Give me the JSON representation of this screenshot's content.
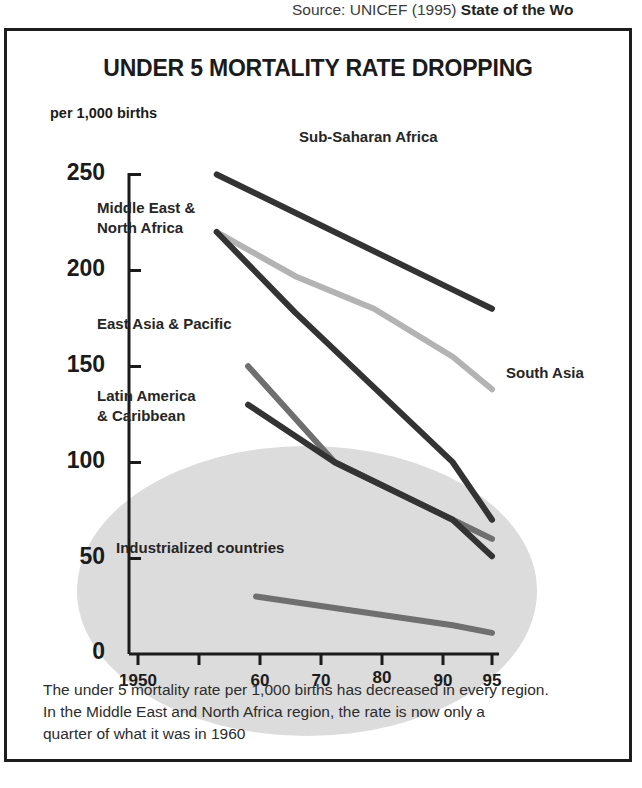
{
  "source": {
    "lead": "Source: UNICEF (1995) ",
    "title": "State of the Wo"
  },
  "chart_title": "UNDER 5 MORTALITY RATE DROPPING",
  "axis_unit": "per 1,000 births",
  "caption": {
    "line1": "The under 5 mortality rate per 1,000 births has decreased in every region.",
    "line2": "In the Middle East and North Africa region, the rate is now only a",
    "line3": "quarter of what it was in 1960"
  },
  "colors": {
    "dark": "#333333",
    "mid": "#6f6f6f",
    "light": "#b3b3b3",
    "axis": "#1b1b1b",
    "shadow": "#dcdcdc",
    "border": "#1d1d1d"
  },
  "chart_data": {
    "type": "line",
    "title": "UNDER 5 MORTALITY RATE DROPPING",
    "xlabel": "",
    "ylabel": "per 1,000 births",
    "ylim": [
      0,
      250
    ],
    "yticks": [
      0,
      50,
      100,
      150,
      200,
      250
    ],
    "ytick_labels": [
      "0",
      "50",
      "100",
      "150",
      "200",
      "250"
    ],
    "xlim": [
      1945,
      1997
    ],
    "xticks": [
      1950,
      1960,
      1970,
      1980,
      1990,
      1995
    ],
    "xtick_labels": [
      "1950",
      "60",
      "70",
      "80",
      "90",
      "95"
    ],
    "grid": false,
    "legend": "inline-labels",
    "series": [
      {
        "name": "Sub-Saharan Africa",
        "color": "#333333",
        "x": [
          1960,
          1990,
          1995
        ],
        "values": [
          250,
          190,
          180
        ],
        "label_x": 1972,
        "label_y": 258
      },
      {
        "name": "South Asia",
        "color": "#b3b3b3",
        "x": [
          1960,
          1970,
          1980,
          1990,
          1995
        ],
        "values": [
          220,
          197,
          180,
          155,
          138
        ],
        "label_x": 1997,
        "label_y": 140
      },
      {
        "name": "Middle East &\nNorth Africa",
        "color": "#333333",
        "x": [
          1960,
          1970,
          1990,
          1995
        ],
        "values": [
          220,
          178,
          100,
          70
        ],
        "label_x": 1953,
        "label_y": 205
      },
      {
        "name": "East Asia & Pacific",
        "color": "#6f6f6f",
        "x": [
          1964,
          1975,
          1990,
          1995
        ],
        "values": [
          150,
          100,
          70,
          60
        ],
        "label_x": 1953,
        "label_y": 158
      },
      {
        "name": "Latin America\n& Caribbean",
        "color": "#333333",
        "x": [
          1964,
          1975,
          1990,
          1995
        ],
        "values": [
          130,
          100,
          70,
          51
        ],
        "label_x": 1953,
        "label_y": 126
      },
      {
        "name": "Industrialized countries",
        "color": "#6f6f6f",
        "x": [
          1965,
          1980,
          1990,
          1995
        ],
        "values": [
          30,
          21,
          15,
          11
        ],
        "label_x": 1955,
        "label_y": 56
      }
    ]
  },
  "series_labels": {
    "sub_saharan_africa": "Sub-Saharan Africa",
    "south_asia": "South Asia",
    "middle_east_north_africa_l1": "Middle East &",
    "middle_east_north_africa_l2": "North Africa",
    "east_asia_pacific": "East Asia & Pacific",
    "latin_america_l1": "Latin America",
    "latin_america_l2": "& Caribbean",
    "industrialized_countries": "Industrialized countries"
  },
  "ytick_labels": {
    "t250": "250",
    "t200": "200",
    "t150": "150",
    "t100": "100",
    "t50": "50",
    "t0": "0"
  },
  "xtick_labels": {
    "t1950": "1950",
    "t60": "60",
    "t70": "70",
    "t80": "80",
    "t90": "90",
    "t95": "95"
  }
}
